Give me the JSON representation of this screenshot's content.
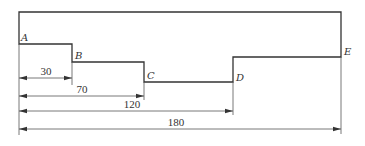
{
  "diagram": {
    "type": "stepped-profile-dimension-drawing",
    "points": [
      {
        "id": "A",
        "label": "A"
      },
      {
        "id": "B",
        "label": "B"
      },
      {
        "id": "C",
        "label": "C"
      },
      {
        "id": "D",
        "label": "D"
      },
      {
        "id": "E",
        "label": "E"
      }
    ],
    "dimensions": [
      {
        "from": "A",
        "to": "B",
        "value": "30"
      },
      {
        "from": "A",
        "to": "C",
        "value": "70"
      },
      {
        "from": "A",
        "to": "D",
        "value": "120"
      },
      {
        "from": "A",
        "to": "E",
        "value": "180"
      }
    ],
    "colors": {
      "outline": "#333333",
      "dimension": "#555555",
      "background": "#ffffff"
    }
  }
}
